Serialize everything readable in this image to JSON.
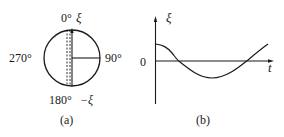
{
  "panel_a": {
    "caption": "(a)",
    "labels": {
      "top_angle": "0°",
      "top_symbol": "ξ",
      "right_angle": "90°",
      "bottom_angle": "180°",
      "bottom_symbol": "−ξ",
      "left_angle": "270°"
    },
    "circle": {
      "cx": 72,
      "cy": 58,
      "r": 28
    }
  },
  "panel_b": {
    "caption": "(b)",
    "y_label": "ξ",
    "x_label": "t",
    "origin_label": "0",
    "curve": "cosine-like oscillation starting at positive value, crossing zero, reaching minimum, rising again"
  },
  "colors": {
    "ink": "#1a1a1a",
    "background": "#ffffff"
  }
}
